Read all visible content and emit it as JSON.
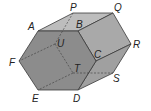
{
  "diagram": {
    "type": "hexagonal-prism",
    "colors": {
      "background": "#ffffff",
      "front_face": "#8c8c8c",
      "top_face": "#bdbdbd",
      "upper_right_face": "#a9a9a9",
      "lower_right_face": "#a0a0a0",
      "edge": "#3a3a3a",
      "hidden_edge": "#3a3a3a",
      "label": "#222222"
    },
    "vertices": {
      "A": [
        38,
        31
      ],
      "B": [
        78,
        31
      ],
      "C": [
        96,
        61
      ],
      "D": [
        78,
        90
      ],
      "E": [
        38,
        90
      ],
      "F": [
        19,
        61
      ],
      "P": [
        73,
        13
      ],
      "Q": [
        113,
        13
      ],
      "R": [
        131,
        44
      ],
      "S": [
        113,
        73
      ],
      "T": [
        73,
        73
      ],
      "U": [
        55,
        44
      ]
    },
    "labels": [
      {
        "text": "P",
        "x": 70,
        "y": 11
      },
      {
        "text": "Q",
        "x": 114,
        "y": 11
      },
      {
        "text": "A",
        "x": 28,
        "y": 30
      },
      {
        "text": "B",
        "x": 76,
        "y": 28
      },
      {
        "text": "U",
        "x": 57,
        "y": 47
      },
      {
        "text": "R",
        "x": 133,
        "y": 48
      },
      {
        "text": "F",
        "x": 9,
        "y": 66
      },
      {
        "text": "C",
        "x": 94,
        "y": 58
      },
      {
        "text": "T",
        "x": 74,
        "y": 72
      },
      {
        "text": "S",
        "x": 113,
        "y": 82
      },
      {
        "text": "E",
        "x": 32,
        "y": 102
      },
      {
        "text": "D",
        "x": 73,
        "y": 102
      }
    ]
  }
}
